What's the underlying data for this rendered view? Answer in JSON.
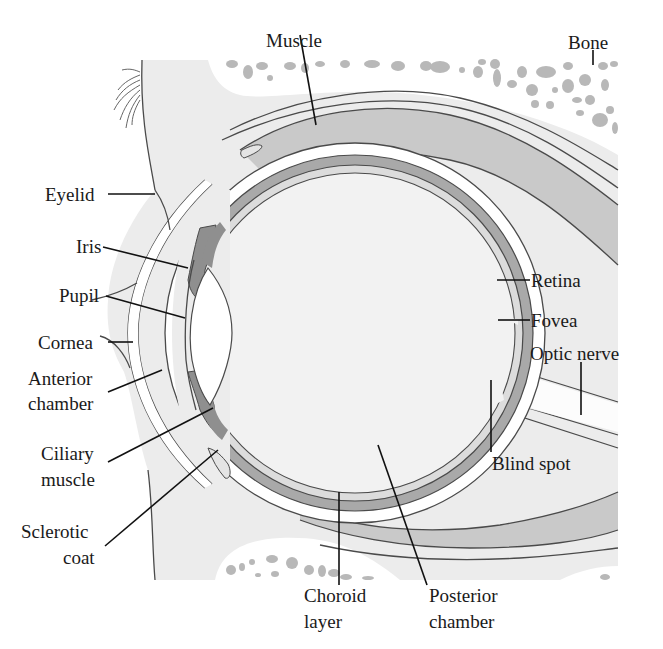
{
  "diagram": {
    "colors": {
      "background": "#ffffff",
      "tissue": "#ececec",
      "vitreous": "#f2f2f2",
      "bone": "#ffffff",
      "bone_cells": "#b8b8b8",
      "muscle": "#c9c9c9",
      "choroid": "#a9a9a9",
      "iris": "#8f8f8f",
      "sclera": "#ffffff",
      "lens": "#ffffff",
      "leader_line": "#111111"
    },
    "labels": {
      "muscle": "Muscle",
      "bone": "Bone",
      "eyelid": "Eyelid",
      "iris": "Iris",
      "pupil": "Pupil",
      "cornea": "Cornea",
      "anterior_chamber_1": "Anterior",
      "anterior_chamber_2": "chamber",
      "ciliary_muscle_1": "Ciliary",
      "ciliary_muscle_2": "muscle",
      "sclerotic_coat_1": "Sclerotic",
      "sclerotic_coat_2": "coat",
      "retina": "Retina",
      "fovea": "Fovea",
      "optic_nerve": "Optic nerve",
      "blind_spot": "Blind spot",
      "choroid_layer_1": "Choroid",
      "choroid_layer_2": "layer",
      "posterior_chamber_1": "Posterior",
      "posterior_chamber_2": "chamber"
    }
  }
}
